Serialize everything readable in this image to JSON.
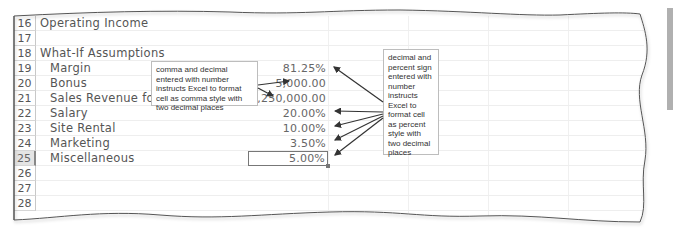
{
  "worksheet": {
    "rows": [
      {
        "num": "16",
        "label": "Operating Income",
        "indent": false,
        "value": ""
      },
      {
        "num": "17",
        "label": "",
        "indent": false,
        "value": ""
      },
      {
        "num": "18",
        "label": "What-If Assumptions",
        "indent": false,
        "value": ""
      },
      {
        "num": "19",
        "label": "Margin",
        "indent": true,
        "value": "81.25%"
      },
      {
        "num": "20",
        "label": "Bonus",
        "indent": true,
        "value": "5,000.00"
      },
      {
        "num": "21",
        "label": "Sales Revenue for Bor",
        "indent": true,
        "value": "1,250,000.00"
      },
      {
        "num": "22",
        "label": "Salary",
        "indent": true,
        "value": "20.00%"
      },
      {
        "num": "23",
        "label": "Site Rental",
        "indent": true,
        "value": "10.00%"
      },
      {
        "num": "24",
        "label": "Marketing",
        "indent": true,
        "value": "3.50%"
      },
      {
        "num": "25",
        "label": "Miscellaneous",
        "indent": true,
        "value": "5.00%",
        "selected": true
      },
      {
        "num": "26",
        "label": "",
        "indent": false,
        "value": ""
      },
      {
        "num": "27",
        "label": "",
        "indent": false,
        "value": ""
      },
      {
        "num": "28",
        "label": "",
        "indent": false,
        "value": ""
      }
    ]
  },
  "callouts": {
    "comma": "comma and decimal entered with number instructs Excel to format cell as comma style with two decimal places",
    "percent": "decimal and percent sign entered with number instructs Excel to format cell as percent style with two decimal places"
  },
  "colors": {
    "arrow": "#333333",
    "frame": "#555555",
    "side_tab": "#b0b0b0"
  }
}
